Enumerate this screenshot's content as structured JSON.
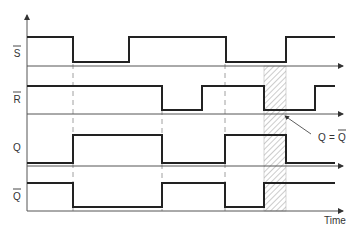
{
  "diagram": {
    "type": "timing-diagram",
    "signals": [
      {
        "name": "S",
        "label": "S",
        "inverted": true,
        "transitions_x": [
          73,
          129,
          226,
          286
        ],
        "initial": "high"
      },
      {
        "name": "R",
        "label": "R",
        "inverted": true,
        "transitions_x": [
          162,
          202,
          264,
          315
        ],
        "initial": "high"
      },
      {
        "name": "Q",
        "label": "Q",
        "inverted": false,
        "transitions_x": [
          73,
          162,
          225,
          286
        ],
        "initial": "low"
      },
      {
        "name": "Q_bar",
        "label": "Q",
        "inverted": true,
        "transitions_x": [
          73,
          162,
          225,
          264
        ],
        "initial": "high"
      }
    ],
    "x_axis_label": "Time",
    "annotation": {
      "left": "Q",
      "eq": "=",
      "right": "Q",
      "right_inverted": true
    },
    "hatched_region": {
      "x_start": 264,
      "x_end": 286,
      "meaning": "Q = Q-bar (forbidden state)"
    },
    "dashed_markers_x": [
      73,
      162,
      225
    ]
  }
}
